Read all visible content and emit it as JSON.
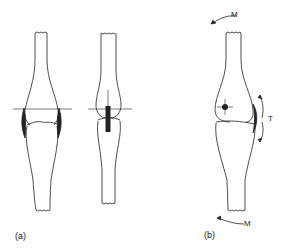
{
  "figure": {
    "panel_a": {
      "label": "(a)"
    },
    "panel_b": {
      "label": "(b)",
      "moment_top": "M",
      "moment_bottom": "M",
      "tension": "T"
    }
  },
  "colors": {
    "stroke": "#222222",
    "background": "#ffffff"
  }
}
